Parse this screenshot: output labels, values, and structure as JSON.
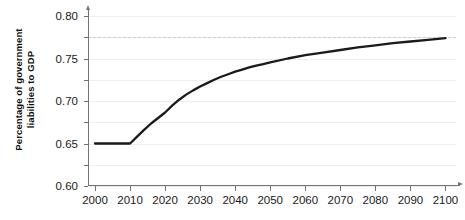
{
  "chart_data": {
    "type": "line",
    "title": "",
    "xlabel": "",
    "ylabel": "Percentage of government liabilities to GDP",
    "ylabel_line1": "Percentage of government",
    "ylabel_line2": "liabilities to GDP",
    "xlim": [
      1998,
      2103
    ],
    "ylim": [
      0.4,
      0.8
    ],
    "grid": true,
    "legend": null,
    "xticks": [
      2000,
      2010,
      2020,
      2030,
      2040,
      2050,
      2060,
      2070,
      2080,
      2090,
      2100
    ],
    "xtick_labels": [
      "2000",
      "2010",
      "2020",
      "2030",
      "2040",
      "2050",
      "2060",
      "2070",
      "2080",
      "2090",
      "2100"
    ],
    "yticks": [
      0.4,
      0.45,
      0.5,
      0.55,
      0.6,
      0.65,
      0.7,
      0.75,
      0.8
    ],
    "ytick_labels": [
      "0.40",
      "0.45",
      "0.50",
      "0.55",
      "0.60",
      "0.65",
      "0.70",
      "0.75",
      "0.80"
    ],
    "reference_lines": [
      {
        "name": "long-run-target",
        "y": 0.75,
        "style": "dashed",
        "color": "#c9cfd4"
      }
    ],
    "series": [
      {
        "name": "Government liabilities to GDP",
        "color": "#1a1a1a",
        "linewidth": 2.3,
        "x": [
          2000,
          2002,
          2004,
          2006,
          2008,
          2010,
          2012,
          2014,
          2016,
          2018,
          2020,
          2022,
          2024,
          2026,
          2028,
          2030,
          2032,
          2034,
          2036,
          2038,
          2040,
          2042,
          2044,
          2046,
          2048,
          2050,
          2055,
          2060,
          2065,
          2070,
          2075,
          2080,
          2085,
          2090,
          2095,
          2100
        ],
        "values": [
          0.5,
          0.5,
          0.5,
          0.5,
          0.5,
          0.5,
          0.516,
          0.532,
          0.547,
          0.56,
          0.573,
          0.589,
          0.603,
          0.615,
          0.625,
          0.634,
          0.642,
          0.65,
          0.657,
          0.663,
          0.669,
          0.674,
          0.679,
          0.683,
          0.687,
          0.691,
          0.7,
          0.708,
          0.714,
          0.72,
          0.726,
          0.731,
          0.736,
          0.74,
          0.744,
          0.748
        ]
      }
    ]
  }
}
